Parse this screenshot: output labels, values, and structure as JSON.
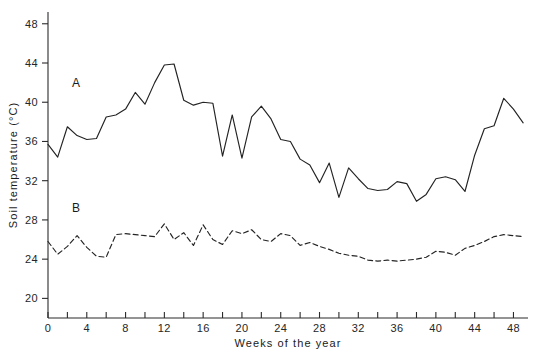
{
  "figure": {
    "title": "",
    "background_color": "#ffffff",
    "line_color": "#232323"
  },
  "axes": {
    "y": {
      "label": "Soil temperature (°C)",
      "ticks": [
        20,
        24,
        28,
        32,
        36,
        40,
        44,
        48
      ],
      "range": [
        18,
        49.2
      ]
    },
    "x": {
      "label": "Weeks of the year",
      "labeled_ticks": [
        0,
        4,
        8,
        12,
        16,
        20,
        24,
        28,
        32,
        36,
        40,
        44,
        48
      ],
      "minor_tick_step": 2,
      "range": [
        0,
        49.5
      ]
    }
  },
  "series_labels": {
    "a": "A",
    "b": "B"
  },
  "chart_data": {
    "type": "line",
    "title": "",
    "xlabel": "Weeks of the year",
    "ylabel": "Soil temperature (°C)",
    "xlim": [
      0,
      49.5
    ],
    "ylim": [
      18,
      49.2
    ],
    "grid": false,
    "legend_position": "inline-annotations",
    "x": [
      0,
      1,
      2,
      3,
      4,
      5,
      6,
      7,
      8,
      9,
      10,
      11,
      12,
      13,
      14,
      15,
      16,
      17,
      18,
      19,
      20,
      21,
      22,
      23,
      24,
      25,
      26,
      27,
      28,
      29,
      30,
      31,
      32,
      33,
      34,
      35,
      36,
      37,
      38,
      39,
      40,
      41,
      42,
      43,
      44,
      45,
      46,
      47,
      48,
      49
    ],
    "series": [
      {
        "name": "A",
        "label": "A",
        "linestyle": "solid",
        "values": [
          35.7,
          34.4,
          37.5,
          36.6,
          36.2,
          36.3,
          38.5,
          38.7,
          39.3,
          41.0,
          39.8,
          42.0,
          43.8,
          43.9,
          40.2,
          39.7,
          40.0,
          39.9,
          34.5,
          38.7,
          34.3,
          38.5,
          39.6,
          38.3,
          36.2,
          36.0,
          34.2,
          33.6,
          31.8,
          33.8,
          30.3,
          33.3,
          32.2,
          31.2,
          31.0,
          31.1,
          31.9,
          31.7,
          29.9,
          30.6,
          32.2,
          32.4,
          32.1,
          30.9,
          34.6,
          37.3,
          37.6,
          40.4,
          39.3,
          37.9
        ]
      },
      {
        "name": "B",
        "label": "B",
        "linestyle": "dashed",
        "values": [
          25.8,
          24.5,
          25.3,
          26.4,
          25.2,
          24.3,
          24.2,
          26.5,
          26.6,
          26.5,
          26.4,
          26.3,
          27.6,
          26.0,
          26.7,
          25.4,
          27.5,
          26.0,
          25.5,
          26.9,
          26.6,
          27.0,
          26.0,
          25.8,
          26.6,
          26.4,
          25.4,
          25.7,
          25.3,
          25.0,
          24.6,
          24.4,
          24.3,
          23.9,
          23.8,
          23.9,
          23.8,
          23.9,
          24.0,
          24.2,
          24.8,
          24.7,
          24.4,
          25.1,
          25.4,
          25.8,
          26.3,
          26.5,
          26.4,
          26.3
        ]
      }
    ]
  }
}
